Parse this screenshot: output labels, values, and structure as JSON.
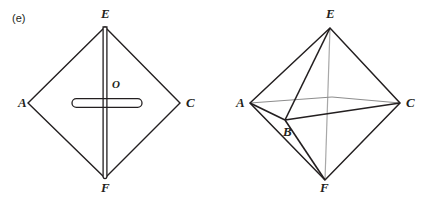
{
  "figure": {
    "part_label": "(e)",
    "background_color": "#ffffff",
    "stroke_color": "#231f20",
    "hidden_stroke_color": "#a8a8a8"
  },
  "left_diagram": {
    "name": "rhombus-with-plate",
    "vertex_labels": [
      {
        "id": "A",
        "text": "A",
        "x": 18,
        "y": 96
      },
      {
        "id": "E",
        "text": "E",
        "x": 101,
        "y": 8
      },
      {
        "id": "C",
        "text": "C",
        "x": 186,
        "y": 96
      },
      {
        "id": "F",
        "text": "F",
        "x": 101,
        "y": 182
      },
      {
        "id": "O",
        "text": "O",
        "x": 112,
        "y": 78
      }
    ],
    "vertices": {
      "A": {
        "x": 28,
        "y": 103
      },
      "E": {
        "x": 105,
        "y": 27
      },
      "C": {
        "x": 180,
        "y": 103
      },
      "F": {
        "x": 105,
        "y": 178
      },
      "O": {
        "x": 105,
        "y": 103
      }
    },
    "plate": {
      "vertical_bar": {
        "x1": 105,
        "y1": 27,
        "x2": 105,
        "y2": 178,
        "thickness": 4
      },
      "horizontal_bar": {
        "x1": 72,
        "y1": 103,
        "x2": 142,
        "y2": 103,
        "thickness": 8
      }
    }
  },
  "right_diagram": {
    "name": "octahedron",
    "vertex_labels": [
      {
        "id": "E",
        "text": "E",
        "x": 326,
        "y": 8
      },
      {
        "id": "A",
        "text": "A",
        "x": 236,
        "y": 96
      },
      {
        "id": "C",
        "text": "C",
        "x": 406,
        "y": 96
      },
      {
        "id": "B",
        "text": "B",
        "x": 286,
        "y": 126
      },
      {
        "id": "F",
        "text": "F",
        "x": 320,
        "y": 182
      }
    ],
    "vertices": {
      "E": {
        "x": 330,
        "y": 28
      },
      "A": {
        "x": 250,
        "y": 103
      },
      "C": {
        "x": 400,
        "y": 103
      },
      "B": {
        "x": 285,
        "y": 120
      },
      "D": {
        "x": 332,
        "y": 97
      },
      "F": {
        "x": 325,
        "y": 180
      }
    },
    "edges": [
      {
        "from": "A",
        "to": "E",
        "style": "solid"
      },
      {
        "from": "E",
        "to": "C",
        "style": "solid"
      },
      {
        "from": "A",
        "to": "F",
        "style": "solid"
      },
      {
        "from": "F",
        "to": "C",
        "style": "solid"
      },
      {
        "from": "A",
        "to": "B",
        "style": "solid"
      },
      {
        "from": "B",
        "to": "C",
        "style": "solid"
      },
      {
        "from": "B",
        "to": "E",
        "style": "solid"
      },
      {
        "from": "B",
        "to": "F",
        "style": "solid"
      },
      {
        "from": "A",
        "to": "D",
        "style": "hidden"
      },
      {
        "from": "D",
        "to": "C",
        "style": "hidden"
      },
      {
        "from": "E",
        "to": "F",
        "style": "hidden"
      }
    ]
  }
}
